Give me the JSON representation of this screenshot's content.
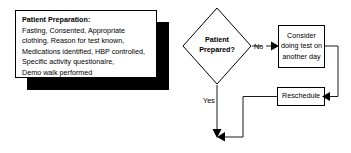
{
  "diagram": {
    "type": "flowchart",
    "background_color": "#ffffff",
    "line_color": "#000000",
    "shadow_color": "#000000",
    "note": {
      "name": "patient-preparation-note",
      "title": "Patient Preparation:",
      "lines": [
        "Fasting, Consented, Appropriate",
        "clothing, Reason for test known,",
        "Medications identified, HBP controlled,",
        "Specific activity questionaire,",
        "Demo walk performed"
      ]
    },
    "decision": {
      "name": "patient-prepared-decision",
      "line1": "Patient",
      "line2": "Prepared?"
    },
    "boxes": [
      {
        "name": "consider-doing-test-box",
        "text": "Consider doing test on another day"
      },
      {
        "name": "reschedule-box",
        "text": "Reschedule"
      }
    ],
    "edges": [
      {
        "name": "edge-no",
        "label": "No"
      },
      {
        "name": "edge-yes",
        "label": "Yes"
      }
    ]
  }
}
